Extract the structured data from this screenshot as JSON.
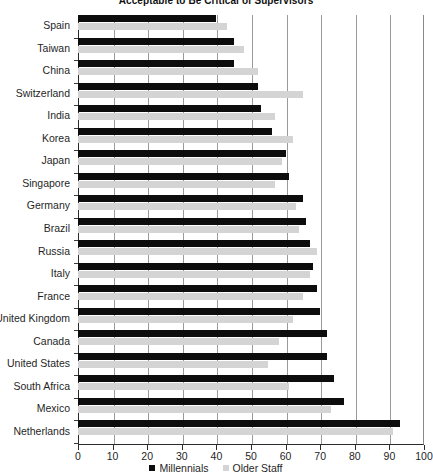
{
  "chart_data": {
    "type": "bar",
    "orientation": "horizontal",
    "title": "Acceptable to Be Critical of Supervisors",
    "xlabel": "",
    "ylabel": "",
    "xlim": [
      0,
      100
    ],
    "xticks": [
      0,
      10,
      20,
      30,
      40,
      50,
      60,
      70,
      80,
      90,
      100
    ],
    "grid": true,
    "legend_position": "bottom",
    "categories": [
      "Spain",
      "Taiwan",
      "China",
      "Switzerland",
      "India",
      "Korea",
      "Japan",
      "Singapore",
      "Germany",
      "Brazil",
      "Russia",
      "Italy",
      "France",
      "United Kingdom",
      "Canada",
      "United States",
      "South Africa",
      "Mexico",
      "Netherlands"
    ],
    "series": [
      {
        "name": "Millennials",
        "color": "#0d0d0d",
        "values": [
          40,
          45,
          45,
          52,
          53,
          56,
          60,
          61,
          65,
          66,
          67,
          68,
          69,
          70,
          72,
          72,
          74,
          77,
          93
        ]
      },
      {
        "name": "Older Staff",
        "color": "#d4d4d4",
        "values": [
          43,
          48,
          52,
          65,
          57,
          62,
          59,
          57,
          63,
          64,
          69,
          67,
          65,
          62,
          58,
          55,
          61,
          73,
          91
        ]
      }
    ]
  },
  "legend": {
    "items": [
      {
        "label": "Millennials",
        "color": "#0d0d0d"
      },
      {
        "label": "Older Staff",
        "color": "#d4d4d4"
      }
    ]
  }
}
